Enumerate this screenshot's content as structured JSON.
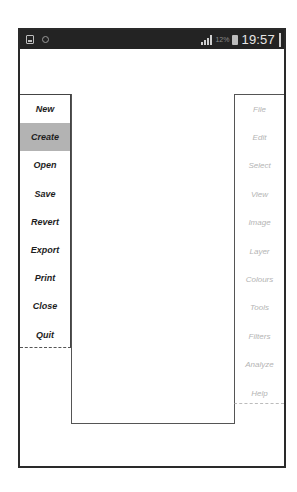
{
  "status_bar": {
    "icons_left": [
      "image-icon",
      "sync-icon"
    ],
    "signal": "signal-icon",
    "battery_percent": "12%",
    "battery_icon": "battery-icon",
    "time": "19:57"
  },
  "left_menu": {
    "active_index": 1,
    "items": [
      {
        "label": "New"
      },
      {
        "label": "Create"
      },
      {
        "label": "Open"
      },
      {
        "label": "Save"
      },
      {
        "label": "Revert"
      },
      {
        "label": "Export"
      },
      {
        "label": "Print"
      },
      {
        "label": "Close"
      },
      {
        "label": "Quit"
      }
    ]
  },
  "right_menu": {
    "items": [
      {
        "label": "File"
      },
      {
        "label": "Edit"
      },
      {
        "label": "Select"
      },
      {
        "label": "View"
      },
      {
        "label": "Image"
      },
      {
        "label": "Layer"
      },
      {
        "label": "Colours"
      },
      {
        "label": "Tools"
      },
      {
        "label": "Filters"
      },
      {
        "label": "Analyze"
      },
      {
        "label": "Help"
      }
    ]
  },
  "colors": {
    "status_bar_bg": "#232323",
    "active_item_bg": "#b3b3b3",
    "disabled_text": "#b4b4b4"
  }
}
